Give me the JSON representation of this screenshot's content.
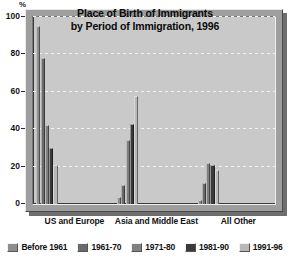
{
  "chart_data": {
    "type": "bar",
    "title": "Place of Birth of Immigrants by Period of Immigration, 1996",
    "title_line1": "Place of Birth of Immigrants",
    "title_line2": "by Period of Immigration, 1996",
    "xlabel": "",
    "ylabel": "%",
    "y_unit": "%",
    "ylim": [
      0,
      100
    ],
    "yticks": [
      0,
      20,
      40,
      60,
      80,
      100
    ],
    "ytick_labels": [
      "0",
      "20",
      "40",
      "60",
      "80",
      "100"
    ],
    "grid": true,
    "grid_orientation": "horizontal",
    "legend_position": "bottom",
    "categories": [
      "US and Europe",
      "Asia and Middle East",
      "All Other"
    ],
    "series": [
      {
        "name": "Before 1961",
        "color": "#8e8e8e",
        "values": [
          95,
          4,
          2
        ]
      },
      {
        "name": "1961-70",
        "color": "#6a6a6a",
        "values": [
          78,
          10,
          11
        ]
      },
      {
        "name": "1971-80",
        "color": "#808080",
        "values": [
          42,
          34,
          22
        ]
      },
      {
        "name": "1981-90",
        "color": "#3a3a3a",
        "values": [
          30,
          43,
          21
        ]
      },
      {
        "name": "1991-96",
        "color": "#b8b8b8",
        "values": [
          21,
          58,
          18
        ]
      }
    ]
  },
  "colors": {
    "page_background": "#ffffff",
    "plot_background": "#c9c9c9",
    "frame": "#9e9e9e",
    "shadow": "#6e6e6e",
    "gridline": "#f4f4f4",
    "axis": "#3a3a3a",
    "text": "#121212"
  }
}
